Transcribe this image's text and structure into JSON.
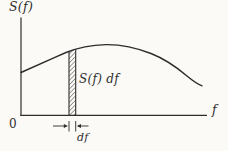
{
  "figure": {
    "y_axis_label": "S(f)",
    "x_axis_label": "f",
    "origin_label": "0",
    "strip_label": "S(f) df",
    "interval_label": "df"
  },
  "colors": {
    "ink": "#2d2d2d",
    "background": "#fbfaf7"
  }
}
